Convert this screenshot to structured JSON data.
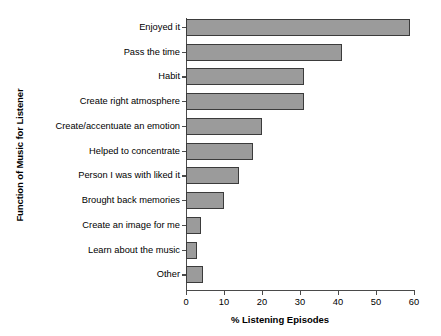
{
  "chart_data": {
    "type": "bar",
    "orientation": "horizontal",
    "title": "",
    "xlabel": "% Listening Episodes",
    "ylabel": "Function of Music for Listener",
    "xlim": [
      0,
      60
    ],
    "xticks": [
      0,
      10,
      20,
      30,
      40,
      50,
      60
    ],
    "grid": false,
    "legend": null,
    "bar_color": "#9b9b9b",
    "bar_edge_color": "#3b3b3b",
    "axis_color": "#4a4a4a",
    "categories": [
      "Enjoyed it",
      "Pass the time",
      "Habit",
      "Create right atmosphere",
      "Create/accentuate an emotion",
      "Helped to concentrate",
      "Person I was with liked it",
      "Brought back memories",
      "Create an image for me",
      "Learn about the music",
      "Other"
    ],
    "values": [
      59,
      41,
      31,
      31,
      20,
      17.5,
      14,
      10,
      4,
      2.8,
      4.5
    ]
  }
}
